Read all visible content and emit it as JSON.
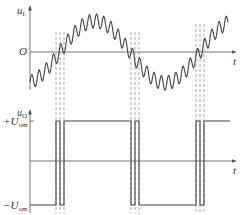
{
  "figure": {
    "type": "comparator-chatter-waveform",
    "colors": {
      "line": "#555555",
      "axis": "#666666",
      "dash": "#888888",
      "background": "#ffffff"
    }
  },
  "top_plot": {
    "y_axis_label": "u",
    "y_axis_subscript": "I",
    "origin_label": "O",
    "x_axis_label": "t",
    "description": "Noisy sinusoidal input signal crossing zero several times near each zero crossing"
  },
  "bottom_plot": {
    "y_axis_label": "u",
    "y_axis_subscript": "O",
    "x_axis_label": "t",
    "positive_level_label": "+U",
    "positive_level_subscript": "om",
    "negative_level_label": "−U",
    "negative_level_subscript": "om",
    "description": "Comparator output square wave with multiple chattering transitions at each input zero crossing"
  },
  "chart_data": {
    "type": "line",
    "title": "",
    "series": [
      {
        "name": "u_I (input with noise)",
        "x": [
          0,
          0.25,
          0.5,
          0.75,
          1.0,
          1.25,
          1.5,
          1.75,
          2.0
        ],
        "values": [
          -0.6,
          -0.25,
          0,
          0.7,
          1.0,
          0.7,
          0,
          -0.7,
          -1.0
        ],
        "note": "sine wave plus high-frequency ripple"
      },
      {
        "name": "u_O (comparator output)",
        "levels": [
          "+U_om",
          "-U_om"
        ],
        "segments": [
          {
            "from": "start",
            "to": "crossing_1",
            "level": "-U_om"
          },
          {
            "from": "crossing_1",
            "to": "crossing_2",
            "level": "+U_om",
            "chatter_pulses": 2
          },
          {
            "from": "crossing_2",
            "to": "crossing_3",
            "level": "-U_om",
            "chatter_pulses": 2
          },
          {
            "from": "crossing_3",
            "to": "end",
            "level": "+U_om",
            "chatter_pulses": 2
          }
        ]
      }
    ],
    "xlabel": "t",
    "ylabel_top": "u_I",
    "ylabel_bottom": "u_O",
    "grid": false,
    "dashed_guides_at_crossings": 3
  }
}
